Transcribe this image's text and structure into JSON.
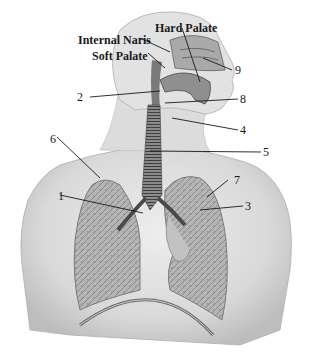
{
  "diagram": {
    "named_labels": {
      "hard_palate": "Hard Palate",
      "internal_naris": "Internal Naris",
      "soft_palate": "Soft Palate"
    },
    "numbered_labels": [
      "1",
      "2",
      "3",
      "4",
      "5",
      "6",
      "7",
      "8",
      "9"
    ],
    "colors": {
      "ink": "#1a1a1a",
      "skin_light": "#e4e4e4",
      "skin_mid": "#c8c8c8",
      "lung": "#9a9a9a",
      "trachea": "#6e6e6e",
      "background": "#ffffff"
    }
  }
}
